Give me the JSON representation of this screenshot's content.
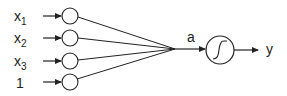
{
  "diagram": {
    "inputs": [
      {
        "label": "x",
        "subscript": "1"
      },
      {
        "label": "x",
        "subscript": "2"
      },
      {
        "label": "x",
        "subscript": "3"
      },
      {
        "label": "1",
        "subscript": ""
      }
    ],
    "sum_label": "a",
    "activation_icon": "sigmoid-icon",
    "output_label": "y",
    "colors": {
      "stroke": "#222222",
      "background": "#ffffff"
    }
  }
}
